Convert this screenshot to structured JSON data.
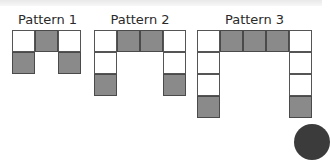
{
  "patterns": [
    {
      "title": "Pattern 1",
      "cells": [
        {
          "row": 0,
          "col": 0,
          "shaded": false
        },
        {
          "row": 0,
          "col": 1,
          "shaded": true
        },
        {
          "row": 0,
          "col": 2,
          "shaded": false
        },
        {
          "row": 1,
          "col": 0,
          "shaded": true
        },
        {
          "row": 1,
          "col": 2,
          "shaded": true
        }
      ]
    },
    {
      "title": "Pattern 2",
      "cells": [
        {
          "row": 0,
          "col": 0,
          "shaded": false
        },
        {
          "row": 0,
          "col": 1,
          "shaded": true
        },
        {
          "row": 0,
          "col": 2,
          "shaded": true
        },
        {
          "row": 0,
          "col": 3,
          "shaded": false
        },
        {
          "row": 1,
          "col": 0,
          "shaded": false
        },
        {
          "row": 1,
          "col": 3,
          "shaded": false
        },
        {
          "row": 2,
          "col": 0,
          "shaded": true
        },
        {
          "row": 2,
          "col": 3,
          "shaded": true
        }
      ]
    },
    {
      "title": "Pattern 3",
      "cells": [
        {
          "row": 0,
          "col": 0,
          "shaded": false
        },
        {
          "row": 0,
          "col": 1,
          "shaded": true
        },
        {
          "row": 0,
          "col": 2,
          "shaded": true
        },
        {
          "row": 0,
          "col": 3,
          "shaded": true
        },
        {
          "row": 0,
          "col": 4,
          "shaded": false
        },
        {
          "row": 1,
          "col": 0,
          "shaded": false
        },
        {
          "row": 1,
          "col": 4,
          "shaded": false
        },
        {
          "row": 2,
          "col": 0,
          "shaded": false
        },
        {
          "row": 2,
          "col": 4,
          "shaded": false
        },
        {
          "row": 3,
          "col": 0,
          "shaded": true
        },
        {
          "row": 3,
          "col": 4,
          "shaded": true
        }
      ]
    }
  ],
  "colors": {
    "shaded": "#8a8a8a",
    "unshaded": "#ffffff",
    "border": "#555555"
  }
}
